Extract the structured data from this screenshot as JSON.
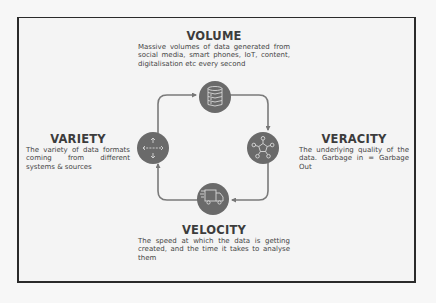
{
  "diagram": {
    "type": "cycle",
    "colors": {
      "circle_fill": "#6a6a6a",
      "icon_stroke": "#d6d6d6",
      "connector": "#777777",
      "frame_border": "#2b2b2b",
      "text": "#454545",
      "title": "#3c3c3c"
    },
    "nodes": [
      {
        "id": "volume",
        "title": "VOLUME",
        "description": "Massive volumes of data generated from social media, smart phones, IoT, content, digitalisation etc every second",
        "icon": "database-icon"
      },
      {
        "id": "veracity",
        "title": "VERACITY",
        "description": "The underlying quality of the data. Garbage in = Garbage Out",
        "icon": "network-hub-icon"
      },
      {
        "id": "velocity",
        "title": "VELOCITY",
        "description": "The speed at which the data is getting created, and the time it takes to analyse them",
        "icon": "fast-truck-icon"
      },
      {
        "id": "variety",
        "title": "VARIETY",
        "description": "The variety of data formats coming from different systems & sources",
        "icon": "four-way-arrows-icon"
      }
    ],
    "edges": [
      {
        "from": "variety",
        "to": "volume"
      },
      {
        "from": "volume",
        "to": "veracity"
      },
      {
        "from": "veracity",
        "to": "velocity"
      },
      {
        "from": "velocity",
        "to": "variety"
      }
    ]
  }
}
